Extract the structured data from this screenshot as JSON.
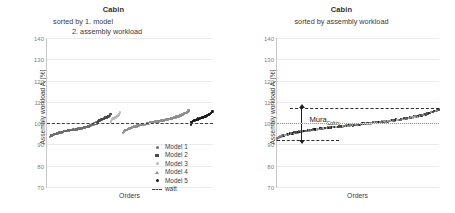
{
  "figure": {
    "background": "#ffffff"
  },
  "panels": [
    {
      "id": "left",
      "title": "Cabin",
      "subtitle_line1": "sorted by 1. model",
      "subtitle_line2": "2. assembly workload",
      "xlabel": "Orders",
      "ylabel_main": "Assembly workload  A",
      "ylabel_sub": "i",
      "ylabel_unit": " [%]",
      "watt_style": "dashed"
    },
    {
      "id": "right",
      "title": "Cabin",
      "subtitle_line1": "sorted by assembly workload",
      "xlabel": "Orders",
      "ylabel_main": "Assembly workload  A",
      "ylabel_sub": "i",
      "ylabel_unit": " [%]",
      "watt_style": "dotted",
      "annotation": {
        "label_main": "Mura",
        "label_sub": "Cabin",
        "lower_value": 92.0,
        "upper_value": 107.0
      }
    }
  ],
  "legend": {
    "entries": [
      {
        "label": "Model 1",
        "marker": "dot",
        "color": "#6f6f6f"
      },
      {
        "label": "Model 2",
        "marker": "square",
        "color": "#4a4a4a"
      },
      {
        "label": "Model 3",
        "marker": "dot",
        "color": "#b9b9b9"
      },
      {
        "label": "Model 4",
        "marker": "tri",
        "color": "#8d8d8d"
      },
      {
        "label": "Model 5",
        "marker": "dot",
        "color": "#1d1d1d"
      },
      {
        "label": "watt",
        "marker": "line",
        "color": "#3d3d3d"
      }
    ]
  },
  "chart_data": {
    "type": "scatter",
    "title": "Cabin",
    "xlabel": "Orders",
    "ylabel": "Assembly workload A_i [%]",
    "ylim": [
      70,
      140
    ],
    "yticks": [
      70,
      80,
      90,
      100,
      110,
      120,
      130,
      140
    ],
    "xticks": [],
    "grid": true,
    "reference_line": {
      "name": "watt",
      "value": 100
    },
    "charts": [
      {
        "panel": "left",
        "subtitle": "sorted by 1. model / 2. assembly workload",
        "description": "Orders grouped by model, then sorted ascending by assembly workload within each model group",
        "series": [
          {
            "name": "Model 1",
            "color": "#6f6f6f",
            "x_range": [
              0.02,
              0.3
            ],
            "y_start": 93.5,
            "y_end": 100.5,
            "n": 120
          },
          {
            "name": "Model 2",
            "color": "#4a4a4a",
            "x_range": [
              0.3,
              0.385
            ],
            "y_start": 100.0,
            "y_end": 104.5,
            "n": 40
          },
          {
            "name": "Model 3",
            "color": "#b9b9b9",
            "x_range": [
              0.385,
              0.44
            ],
            "y_start": 100.8,
            "y_end": 105.0,
            "n": 28
          },
          {
            "name": "Model 4",
            "color": "#8d8d8d",
            "x_range": [
              0.46,
              0.855
            ],
            "y_start": 95.5,
            "y_end": 106.0,
            "n": 190
          },
          {
            "name": "Model 5",
            "color": "#1d1d1d",
            "x_range": [
              0.865,
              1.0
            ],
            "y_start": 99.5,
            "y_end": 105.8,
            "n": 65
          }
        ]
      },
      {
        "panel": "right",
        "subtitle": "sorted by assembly workload",
        "description": "All orders of all models sorted ascending by assembly workload; Mura is the spread between min and max workload",
        "mura": {
          "label": "Mura_Cabin",
          "min": 92.0,
          "max": 107.0,
          "span": 15.0
        },
        "series": [
          {
            "name": "All models (mixed)",
            "color": "#555555",
            "x_range": [
              0.0,
              1.0
            ],
            "y_start": 92.5,
            "y_end": 106.5,
            "n": 430
          }
        ]
      }
    ]
  }
}
